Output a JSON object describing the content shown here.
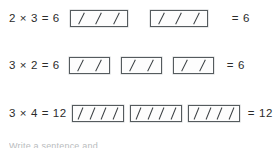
{
  "document": {
    "title": "Multiplication as equal groups",
    "footer_note": "Write a sentence and"
  },
  "chart_data": {
    "type": "table",
    "xlabel": "",
    "ylabel": "",
    "rows": [
      {
        "equation": "2 × 3 = 6",
        "factor_groups": 2,
        "factor_per_group": 3,
        "product": "6",
        "boxes": [
          3,
          3
        ],
        "total_label": "= 6"
      },
      {
        "equation": "3 × 2 = 6",
        "factor_groups": 3,
        "factor_per_group": 2,
        "product": "6",
        "boxes": [
          2,
          2,
          2
        ],
        "total_label": "= 6"
      },
      {
        "equation": "3 × 4 = 12",
        "factor_groups": 3,
        "factor_per_group": 4,
        "product": "12",
        "boxes": [
          4,
          4,
          4
        ],
        "total_label": "= 12"
      }
    ],
    "colors": {
      "text": "#2b2b2b",
      "box_border": "#555b5e",
      "tally_mark": "#3a3f42",
      "background": "#ffffff"
    }
  },
  "rows": [
    {
      "left_operand": "2",
      "operator": "×",
      "right_operand": "3",
      "equals": "=",
      "result": "6",
      "equation": "2 × 3 = 6",
      "total_label": "= 6"
    },
    {
      "left_operand": "3",
      "operator": "×",
      "right_operand": "2",
      "equals": "=",
      "result": "6",
      "equation": "3 × 2 = 6",
      "total_label": "= 6"
    },
    {
      "left_operand": "3",
      "operator": "×",
      "right_operand": "4",
      "equals": "=",
      "result": "12",
      "equation": "3 × 4 = 12",
      "total_label": "= 12"
    }
  ]
}
